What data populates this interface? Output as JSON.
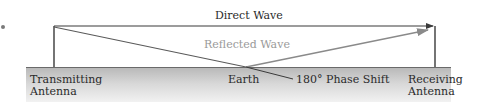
{
  "diagram": {
    "labels": {
      "direct_wave": "Direct Wave",
      "reflected_wave": "Reflected Wave",
      "transmitting_line1": "Transmitting",
      "transmitting_line2": "Antenna",
      "earth": "Earth",
      "phase_shift": "180° Phase Shift",
      "receiving_line1": "Receiving",
      "receiving_line2": "Antenna"
    },
    "colors": {
      "line": "#3a3a3a",
      "reflected_line": "#8a8a8a",
      "reflected_text": "#9a9a9a",
      "ground_top": "#b9b9b9",
      "ground_bottom": "#f3f3f3"
    }
  }
}
